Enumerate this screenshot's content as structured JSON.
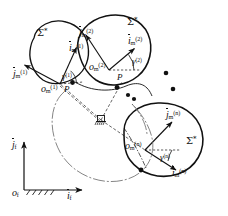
{
  "figure": {
    "type": "mechanism-kinematics-diagram",
    "background": "#ffffff",
    "stroke": "#111111"
  },
  "bodies": [
    {
      "id": "body-1",
      "sigma_label": "Σ",
      "sigma_sup": "*",
      "origin_base": "o",
      "origin_sub": "m",
      "origin_sup": "(1)",
      "axis_i_base": "i",
      "axis_i_sub": "m",
      "axis_i_sup": "(1)",
      "axis_j_base": "j",
      "axis_j_sub": "m",
      "axis_j_sup": "(1)",
      "angle_base": "γ",
      "angle_sup": "(1)",
      "contact_point": "P"
    },
    {
      "id": "body-2",
      "sigma_label": "Σ",
      "sigma_sup": "*",
      "origin_base": "o",
      "origin_sub": "m",
      "origin_sup": "(2)",
      "axis_i_base": "i",
      "axis_i_sub": "m",
      "axis_i_sup": "(2)",
      "axis_j_base": "j",
      "axis_j_sub": "m",
      "axis_j_sup": "(2)",
      "angle_base": "γ",
      "angle_sup": "(2)",
      "contact_point": "P"
    },
    {
      "id": "body-n",
      "sigma_label": "Σ",
      "sigma_sup": "*",
      "origin_base": "o",
      "origin_sub": "m",
      "origin_sup": "(n)",
      "axis_i_base": "i",
      "axis_i_sub": "m",
      "axis_i_sup": "(n)",
      "axis_j_base": "j",
      "axis_j_sub": "m",
      "axis_j_sup": "(n)",
      "angle_base": "γ",
      "angle_sup": "(n)",
      "contact_point": "P"
    }
  ],
  "fixed_frame": {
    "origin_base": "o",
    "origin_sub": "f",
    "axis_i_base": "i",
    "axis_i_sub": "f",
    "axis_j_base": "j",
    "axis_j_sub": "f"
  },
  "ellipsis": {
    "label": "• •",
    "count": 2,
    "meaning": "continuation between body 2 and body n"
  },
  "ground_symbol": {
    "name": "fixed-pivot-ground",
    "hatch_count": 5
  }
}
